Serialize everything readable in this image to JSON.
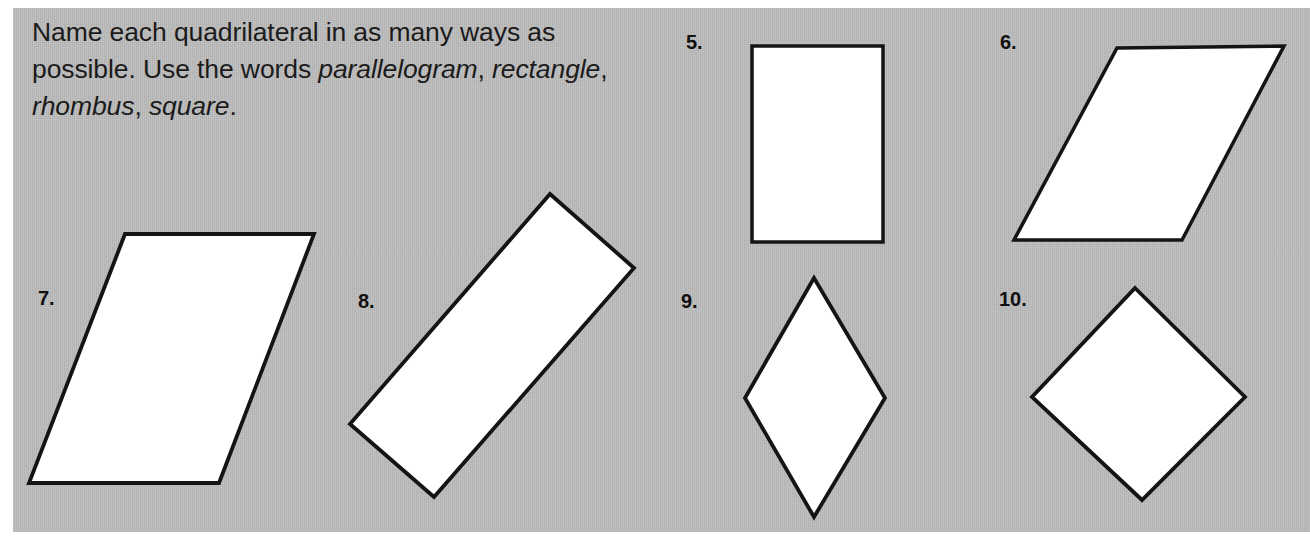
{
  "page": {
    "background_color": "#ffffff",
    "panel_color": "#bcbcbc",
    "width": 1310,
    "height": 545
  },
  "instructions": {
    "line1_plain": "Name each quadrilateral in as many ways",
    "line2_plain": "as possible. Use the words ",
    "term1": "parallelogram",
    "comma1": ",",
    "term2": "rectangle",
    "comma2": ", ",
    "term3": "rhombus",
    "comma3": ", ",
    "term4": "square",
    "period": "."
  },
  "problems": [
    {
      "number": "5.",
      "shape_name": "rectangle",
      "label_x": 686,
      "label_y": 31,
      "svg": {
        "x": 746,
        "y": 40,
        "w": 145,
        "h": 210
      },
      "stroke_width": 3.5,
      "points": "6,6 137,6 137,202 6,202"
    },
    {
      "number": "6.",
      "shape_name": "parallelogram",
      "label_x": 1000,
      "label_y": 31,
      "svg": {
        "x": 1006,
        "y": 38,
        "w": 290,
        "h": 214
      },
      "stroke_width": 3.5,
      "points": "111,10 278,8 176,202 8,202"
    },
    {
      "number": "7.",
      "shape_name": "parallelogram",
      "label_x": 38,
      "label_y": 287,
      "svg": {
        "x": 20,
        "y": 226,
        "w": 306,
        "h": 268
      },
      "stroke_width": 3.8,
      "points": "105,8 294,8 199,257 9,257"
    },
    {
      "number": "8.",
      "shape_name": "rectangle-rotated",
      "label_x": 358,
      "label_y": 290,
      "svg": {
        "x": 342,
        "y": 186,
        "w": 302,
        "h": 320
      },
      "stroke_width": 3.8,
      "points": "208,8 292,82 92,311 8,238"
    },
    {
      "number": "9.",
      "shape_name": "rhombus",
      "label_x": 681,
      "label_y": 290,
      "svg": {
        "x": 737,
        "y": 270,
        "w": 156,
        "h": 256
      },
      "stroke_width": 3.8,
      "points": "77,8 148,128 77,247 8,128"
    },
    {
      "number": "10.",
      "shape_name": "square-rotated",
      "label_x": 999,
      "label_y": 288,
      "svg": {
        "x": 1024,
        "y": 280,
        "w": 229,
        "h": 229
      },
      "stroke_width": 3.8,
      "points": "111,8 221,117 118,220 8,117"
    }
  ]
}
